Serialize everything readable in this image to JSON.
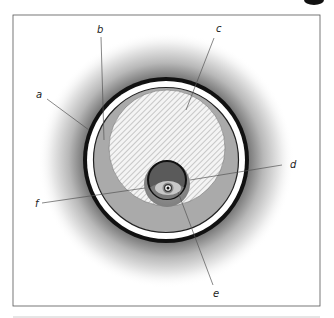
{
  "figure": {
    "title": "",
    "frame": {
      "x": 13,
      "y": 15,
      "width": 307,
      "height": 291,
      "stroke": "#555555"
    },
    "center": {
      "x": 166,
      "y": 160
    },
    "colors": {
      "halo_dark": "#3a3a3a",
      "outer_ring": "#111111",
      "white_ring": "#ffffff",
      "fill_grey": "#aaaaaa",
      "hatch_bg": "#f4f4f4",
      "hatch_line": "#9a9a9a",
      "inner_disk": "#5a5a5a",
      "inner_halo": "#8c8c8c"
    },
    "labels": [
      {
        "id": "a",
        "text": "a",
        "x": 36,
        "y": 98,
        "line": [
          47,
          99,
          89,
          130
        ]
      },
      {
        "id": "b",
        "text": "b",
        "x": 97,
        "y": 33,
        "line": [
          101,
          37,
          104,
          140
        ]
      },
      {
        "id": "c",
        "text": "c",
        "x": 216,
        "y": 32,
        "line": [
          214,
          38,
          186,
          110
        ]
      },
      {
        "id": "d",
        "text": "d",
        "x": 290,
        "y": 168,
        "line": [
          190,
          180,
          282,
          165
        ]
      },
      {
        "id": "e",
        "text": "e",
        "x": 213,
        "y": 297,
        "line": [
          178,
          192,
          213,
          285
        ]
      },
      {
        "id": "f",
        "text": "f",
        "x": 35,
        "y": 207,
        "line": [
          42,
          203,
          145,
          188
        ]
      }
    ]
  }
}
